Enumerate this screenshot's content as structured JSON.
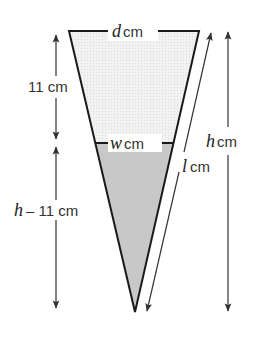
{
  "diagram": {
    "type": "cone-cross-section",
    "colors": {
      "outline": "#1a1a1a",
      "upper_fill": "#ececec",
      "liquid_fill": "#c8c8c8",
      "arrow": "#333333",
      "text": "#333333"
    },
    "labels": {
      "top_width": {
        "var": "d",
        "unit": "cm"
      },
      "liquid_width": {
        "var": "w",
        "unit": "cm"
      },
      "upper_height": {
        "text": "11 cm"
      },
      "lower_height": {
        "var": "h",
        "text": "– 11 cm"
      },
      "total_height": {
        "var": "h",
        "unit": "cm"
      },
      "slant_length": {
        "var": "l",
        "unit": "cm"
      }
    }
  }
}
